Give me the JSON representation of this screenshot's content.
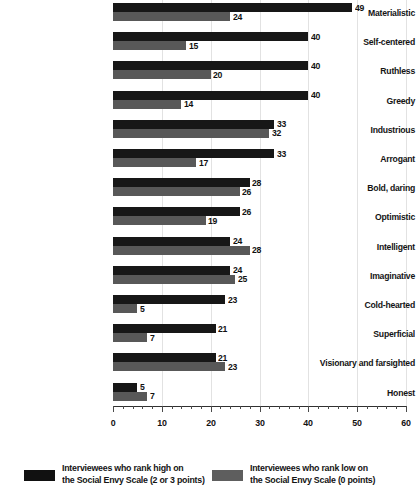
{
  "chart_data": {
    "type": "bar",
    "orientation": "horizontal",
    "title": "",
    "subtitle": "",
    "xlabel": "",
    "ylabel": "",
    "xlim": [
      0,
      60
    ],
    "xticks": [
      0,
      10,
      20,
      30,
      40,
      50,
      60
    ],
    "xtick_labels": [
      "0",
      "10",
      "20",
      "30",
      "40",
      "50",
      "60"
    ],
    "minor_tick_step": 2,
    "grid": true,
    "grid_axis": "x",
    "legend_position": "bottom",
    "categories": [
      "Materialistic",
      "Self-centered",
      "Ruthless",
      "Greedy",
      "Industrious",
      "Arrogant",
      "Bold, daring",
      "Optimistic",
      "Intelligent",
      "Imaginative",
      "Cold-hearted",
      "Superficial",
      "Visionary and farsighted",
      "Honest"
    ],
    "series": [
      {
        "name": "Interviewees who rank high on the Social Envy Scale (2 or 3 points)",
        "color": "#171717",
        "values": [
          49,
          40,
          40,
          40,
          33,
          33,
          28,
          26,
          24,
          24,
          23,
          21,
          21,
          5
        ]
      },
      {
        "name": "Interviewees who rank low on the Social Envy Scale (0 points)",
        "color": "#585858",
        "values": [
          24,
          15,
          20,
          14,
          32,
          17,
          26,
          19,
          28,
          25,
          5,
          7,
          23,
          7
        ]
      }
    ]
  },
  "legend": [
    {
      "swatch": "high",
      "line1": "Interviewees who rank high on",
      "line2": "the Social Envy Scale (2 or 3 points)"
    },
    {
      "swatch": "low",
      "line1": "Interviewees who rank low on",
      "line2": "the Social Envy Scale (0 points)"
    }
  ]
}
